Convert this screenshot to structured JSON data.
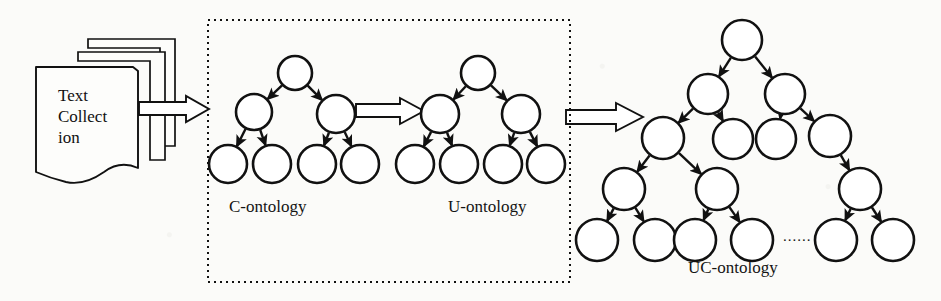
{
  "figure": {
    "type": "flow-diagram",
    "background_color": "#fbfbf9",
    "stroke_color": "#111111"
  },
  "source": {
    "name": "text-collection-stack",
    "text": "Text\nCollect\nion",
    "sheets": 3
  },
  "labels": {
    "c_ontology": "C-ontology",
    "u_ontology": "U-ontology",
    "uc_ontology": "UC-ontology",
    "ellipsis": "......"
  },
  "group_box": {
    "name": "dotted-group-box",
    "border_style": "dotted",
    "x": 208,
    "y": 20,
    "width": 362,
    "height": 262
  },
  "block_arrows": [
    {
      "name": "arrow-collection-to-c",
      "x1": 140,
      "y1": 108,
      "x2": 207,
      "y2": 108
    },
    {
      "name": "arrow-c-to-u",
      "x1": 355,
      "y1": 110,
      "x2": 424,
      "y2": 110
    },
    {
      "name": "arrow-u-to-uc",
      "x1": 565,
      "y1": 117,
      "x2": 640,
      "y2": 117
    }
  ],
  "trees": {
    "c_ontology": {
      "name": "c-ontology-tree",
      "nodes": [
        {
          "id": "c0",
          "cx": 295,
          "cy": 73,
          "r": 17
        },
        {
          "id": "c1",
          "cx": 254,
          "cy": 112,
          "r": 18
        },
        {
          "id": "c2",
          "cx": 336,
          "cy": 114,
          "r": 19
        },
        {
          "id": "c3",
          "cx": 228,
          "cy": 164,
          "r": 19
        },
        {
          "id": "c4",
          "cx": 272,
          "cy": 164,
          "r": 19
        },
        {
          "id": "c5",
          "cx": 317,
          "cy": 164,
          "r": 19
        },
        {
          "id": "c6",
          "cx": 360,
          "cy": 164,
          "r": 19
        }
      ],
      "edges": [
        [
          "c0",
          "c1"
        ],
        [
          "c0",
          "c2"
        ],
        [
          "c1",
          "c3"
        ],
        [
          "c1",
          "c4"
        ],
        [
          "c2",
          "c5"
        ],
        [
          "c2",
          "c6"
        ]
      ]
    },
    "u_ontology": {
      "name": "u-ontology-tree",
      "nodes": [
        {
          "id": "u0",
          "cx": 478,
          "cy": 73,
          "r": 17
        },
        {
          "id": "u1",
          "cx": 440,
          "cy": 114,
          "r": 19
        },
        {
          "id": "u2",
          "cx": 521,
          "cy": 114,
          "r": 19
        },
        {
          "id": "u3",
          "cx": 415,
          "cy": 164,
          "r": 19
        },
        {
          "id": "u4",
          "cx": 459,
          "cy": 164,
          "r": 19
        },
        {
          "id": "u5",
          "cx": 503,
          "cy": 164,
          "r": 19
        },
        {
          "id": "u6",
          "cx": 546,
          "cy": 164,
          "r": 19
        }
      ],
      "edges": [
        [
          "u0",
          "u1"
        ],
        [
          "u0",
          "u2"
        ],
        [
          "u1",
          "u3"
        ],
        [
          "u1",
          "u4"
        ],
        [
          "u2",
          "u5"
        ],
        [
          "u2",
          "u6"
        ]
      ]
    },
    "uc_ontology": {
      "name": "uc-ontology-tree",
      "nodes": [
        {
          "id": "n0",
          "cx": 742,
          "cy": 40,
          "r": 20
        },
        {
          "id": "n1",
          "cx": 708,
          "cy": 94,
          "r": 20
        },
        {
          "id": "n2",
          "cx": 785,
          "cy": 94,
          "r": 20
        },
        {
          "id": "n3",
          "cx": 663,
          "cy": 138,
          "r": 21
        },
        {
          "id": "n4",
          "cx": 733,
          "cy": 139,
          "r": 20
        },
        {
          "id": "n5",
          "cx": 776,
          "cy": 139,
          "r": 20
        },
        {
          "id": "n6",
          "cx": 830,
          "cy": 136,
          "r": 21
        },
        {
          "id": "n7",
          "cx": 624,
          "cy": 189,
          "r": 21
        },
        {
          "id": "n8",
          "cx": 717,
          "cy": 189,
          "r": 21
        },
        {
          "id": "n9",
          "cx": 860,
          "cy": 189,
          "r": 21
        },
        {
          "id": "n10",
          "cx": 597,
          "cy": 240,
          "r": 21
        },
        {
          "id": "n11",
          "cx": 655,
          "cy": 240,
          "r": 21
        },
        {
          "id": "n12",
          "cx": 695,
          "cy": 240,
          "r": 21
        },
        {
          "id": "n13",
          "cx": 752,
          "cy": 240,
          "r": 21
        },
        {
          "id": "n14",
          "cx": 836,
          "cy": 240,
          "r": 21
        },
        {
          "id": "n15",
          "cx": 893,
          "cy": 240,
          "r": 21
        }
      ],
      "edges": [
        [
          "n0",
          "n1"
        ],
        [
          "n0",
          "n2"
        ],
        [
          "n1",
          "n3"
        ],
        [
          "n1",
          "n4"
        ],
        [
          "n2",
          "n5"
        ],
        [
          "n2",
          "n6"
        ],
        [
          "n3",
          "n7"
        ],
        [
          "n3",
          "n8"
        ],
        [
          "n6",
          "n9"
        ],
        [
          "n7",
          "n10"
        ],
        [
          "n7",
          "n11"
        ],
        [
          "n8",
          "n12"
        ],
        [
          "n8",
          "n13"
        ],
        [
          "n9",
          "n14"
        ],
        [
          "n9",
          "n15"
        ]
      ],
      "ellipsis_position": {
        "x": 790,
        "y": 238
      }
    }
  }
}
